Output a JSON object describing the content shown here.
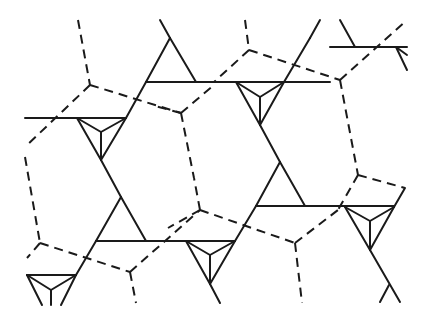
{
  "diagram": {
    "title": "",
    "stroke_color": "#1a1a1a",
    "background": "#ffffff",
    "solid_lines": [
      [
        25,
        118,
        126,
        118
      ],
      [
        160,
        20,
        170,
        38
      ],
      [
        170,
        38,
        146,
        82
      ],
      [
        170,
        38,
        196,
        82
      ],
      [
        146,
        82,
        330,
        82
      ],
      [
        126,
        118,
        146,
        82
      ],
      [
        77,
        118,
        101,
        160
      ],
      [
        126,
        118,
        101,
        160
      ],
      [
        77,
        118,
        101,
        132
      ],
      [
        126,
        118,
        101,
        132
      ],
      [
        101,
        132,
        101,
        160
      ],
      [
        101,
        160,
        121,
        197
      ],
      [
        121,
        197,
        96,
        241
      ],
      [
        121,
        197,
        146,
        241
      ],
      [
        96,
        241,
        235,
        241
      ],
      [
        236,
        82,
        260,
        125
      ],
      [
        284,
        82,
        260,
        125
      ],
      [
        236,
        82,
        260,
        97
      ],
      [
        284,
        82,
        260,
        97
      ],
      [
        260,
        97,
        260,
        125
      ],
      [
        284,
        82,
        310,
        38
      ],
      [
        310,
        38,
        320,
        20
      ],
      [
        260,
        125,
        280,
        162
      ],
      [
        280,
        162,
        256,
        206
      ],
      [
        280,
        162,
        305,
        206
      ],
      [
        256,
        206,
        394,
        206
      ],
      [
        235,
        241,
        256,
        206
      ],
      [
        96,
        241,
        76,
        275
      ],
      [
        186,
        241,
        210,
        284
      ],
      [
        235,
        241,
        210,
        284
      ],
      [
        186,
        241,
        210,
        255
      ],
      [
        235,
        241,
        210,
        255
      ],
      [
        210,
        255,
        210,
        284
      ],
      [
        210,
        284,
        220,
        303
      ],
      [
        27,
        275,
        76,
        275
      ],
      [
        27,
        275,
        42,
        305
      ],
      [
        76,
        275,
        61,
        305
      ],
      [
        27,
        275,
        51,
        290
      ],
      [
        76,
        275,
        51,
        290
      ],
      [
        51,
        290,
        51,
        305
      ],
      [
        345,
        207,
        370,
        250
      ],
      [
        394,
        207,
        370,
        250
      ],
      [
        345,
        207,
        370,
        221
      ],
      [
        394,
        207,
        370,
        221
      ],
      [
        370,
        221,
        370,
        250
      ],
      [
        370,
        250,
        400,
        302
      ],
      [
        389,
        285,
        380,
        302
      ],
      [
        394,
        207,
        405,
        188
      ],
      [
        340,
        20,
        355,
        47
      ],
      [
        330,
        47,
        407,
        47
      ],
      [
        396,
        47,
        407,
        55
      ],
      [
        396,
        47,
        407,
        70
      ]
    ],
    "dashed_lines": [
      [
        78,
        20,
        90,
        85
      ],
      [
        90,
        85,
        25,
        147
      ],
      [
        90,
        85,
        181,
        113
      ],
      [
        245,
        20,
        249,
        50
      ],
      [
        249,
        50,
        214,
        82
      ],
      [
        249,
        50,
        340,
        80
      ],
      [
        181,
        113,
        214,
        85
      ],
      [
        181,
        113,
        155,
        106
      ],
      [
        181,
        113,
        194,
        178
      ],
      [
        340,
        80,
        407,
        20
      ],
      [
        340,
        80,
        358,
        175
      ],
      [
        358,
        175,
        338,
        210
      ],
      [
        358,
        175,
        405,
        188
      ],
      [
        25,
        157,
        40,
        243
      ],
      [
        40,
        243,
        27,
        258
      ],
      [
        40,
        243,
        130,
        272
      ],
      [
        130,
        272,
        136,
        303
      ],
      [
        130,
        272,
        200,
        210
      ],
      [
        200,
        210,
        194,
        178
      ],
      [
        200,
        210,
        168,
        228
      ],
      [
        200,
        210,
        295,
        243
      ],
      [
        295,
        243,
        338,
        210
      ],
      [
        295,
        243,
        302,
        303
      ]
    ],
    "triangles_with_center": [
      {
        "name": "triangle-left",
        "pts": [
          [
            77,
            118
          ],
          [
            126,
            118
          ],
          [
            101,
            160
          ]
        ],
        "center": [
          101,
          132
        ]
      },
      {
        "name": "triangle-mid-right",
        "pts": [
          [
            236,
            82
          ],
          [
            284,
            82
          ],
          [
            260,
            125
          ]
        ],
        "center": [
          260,
          97
        ]
      },
      {
        "name": "triangle-bottom-mid",
        "pts": [
          [
            186,
            241
          ],
          [
            235,
            241
          ],
          [
            210,
            284
          ]
        ],
        "center": [
          210,
          255
        ]
      },
      {
        "name": "triangle-bottom-right",
        "pts": [
          [
            345,
            207
          ],
          [
            394,
            207
          ],
          [
            370,
            250
          ]
        ],
        "center": [
          370,
          221
        ]
      },
      {
        "name": "triangle-bottom-left",
        "pts": [
          [
            27,
            275
          ],
          [
            76,
            275
          ],
          [
            51,
            305
          ]
        ],
        "center": [
          51,
          290
        ]
      }
    ],
    "plain_triangles": [
      {
        "name": "triangle-top",
        "pts": [
          [
            170,
            38
          ],
          [
            146,
            82
          ],
          [
            196,
            82
          ]
        ]
      },
      {
        "name": "triangle-lower-left",
        "pts": [
          [
            121,
            197
          ],
          [
            96,
            241
          ],
          [
            146,
            241
          ]
        ]
      },
      {
        "name": "triangle-lower-right",
        "pts": [
          [
            280,
            162
          ],
          [
            256,
            206
          ],
          [
            305,
            206
          ]
        ]
      }
    ]
  }
}
